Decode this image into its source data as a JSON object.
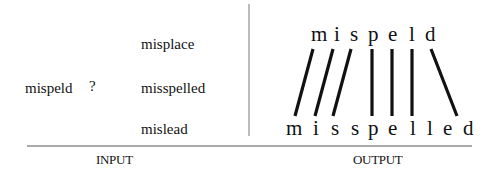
{
  "input": {
    "query": "mispeld",
    "query_mark": "?",
    "candidates": [
      "misplace",
      "misspelled",
      "mislead"
    ],
    "label": "INPUT"
  },
  "output": {
    "source_letters": [
      "m",
      "i",
      "s",
      "p",
      "e",
      "l",
      "d"
    ],
    "target_letters": [
      "m",
      "i",
      "s",
      "s",
      "p",
      "e",
      "l",
      "l",
      "e",
      "d"
    ],
    "alignments": [
      [
        0,
        0
      ],
      [
        1,
        1
      ],
      [
        2,
        2
      ],
      [
        3,
        4
      ],
      [
        4,
        5
      ],
      [
        5,
        6
      ],
      [
        6,
        9
      ]
    ],
    "label": "OUTPUT"
  },
  "colors": {
    "text": "#111111",
    "lines": "#111111",
    "rule": "#555555"
  }
}
